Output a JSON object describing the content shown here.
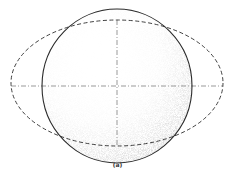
{
  "figure": {
    "caption": "(a)",
    "colors": {
      "stroke": "#2a2a2a",
      "axis": "#555555",
      "shading": "#9a9a9a",
      "background": "#ffffff"
    },
    "sphere": {
      "cx": 117,
      "cy": 86,
      "rx": 75,
      "ry": 77,
      "style": "solid",
      "shaded": true
    },
    "ellipse": {
      "cx": 117,
      "cy": 83,
      "rx": 106,
      "ry": 63,
      "style": "dashed"
    },
    "axes": {
      "horizontal": {
        "x1": 11,
        "y1": 86,
        "x2": 223,
        "y2": 86,
        "style": "dashed"
      },
      "vertical": {
        "x1": 117,
        "y1": 20,
        "x2": 117,
        "y2": 146,
        "style": "dashed"
      }
    }
  }
}
